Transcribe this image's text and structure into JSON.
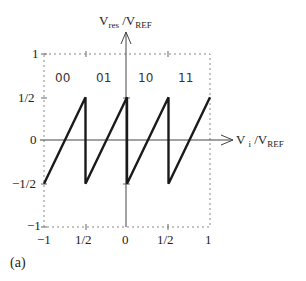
{
  "chart_data": {
    "type": "line",
    "title": "",
    "xlabel": {
      "main": "V",
      "sub1": "i",
      "sep": " /V",
      "sub2": "REF"
    },
    "ylabel": {
      "main": "V",
      "sub1": "res",
      "sep": " /V",
      "sub2": "REF"
    },
    "xlim": [
      -1,
      1
    ],
    "ylim": [
      -1,
      1
    ],
    "grid": false,
    "frame": "dotted",
    "x_tick_labels": [
      "−1",
      "1/2",
      "0",
      "1/2",
      "1"
    ],
    "y_tick_labels": [
      "1",
      "1/2",
      "0",
      "−1/2",
      "−1"
    ],
    "region_codes": [
      "00",
      "01",
      "10",
      "11"
    ],
    "series": [
      {
        "name": "residue transfer",
        "x": [
          -1,
          -0.5,
          -0.5,
          0,
          0,
          0.5,
          0.5,
          1
        ],
        "y": [
          -0.5,
          0.5,
          -0.5,
          0.5,
          -0.5,
          0.5,
          -0.5,
          0.5
        ]
      }
    ],
    "caption": "(a)"
  }
}
